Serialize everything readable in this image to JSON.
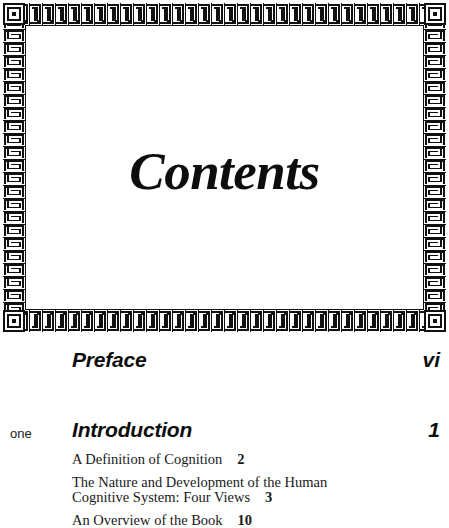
{
  "page": {
    "title": "Contents",
    "background_color": "#ffffff",
    "ink_color": "#0d0d0d"
  },
  "frame": {
    "ornament_name": "greek-key-meander-border",
    "ornament_color": "#111111"
  },
  "toc": {
    "front_matter": [
      {
        "label": "Preface",
        "page": "vi"
      }
    ],
    "chapters": [
      {
        "number_word": "one",
        "title": "Introduction",
        "page": "1",
        "sections": [
          {
            "title": "A Definition of Cognition",
            "page": "2"
          },
          {
            "title": "The Nature and Development of the Human Cognitive System: Four Views",
            "page": "3"
          },
          {
            "title": "An Overview of the Book",
            "page": "10"
          }
        ]
      }
    ]
  }
}
